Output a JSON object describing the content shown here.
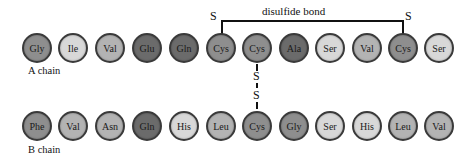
{
  "title": "disulfide bond",
  "colors": {
    "dark": "#6b6b6b",
    "medium": "#8e8e8e",
    "light": "#b3b3b3",
    "very_light": "#d8d8d8",
    "border": "#3a3a3a"
  },
  "a_chain": {
    "label": "A chain",
    "residues": [
      {
        "name": "Gly",
        "shade": "medium"
      },
      {
        "name": "Ile",
        "shade": "very_light"
      },
      {
        "name": "Val",
        "shade": "light"
      },
      {
        "name": "Glu",
        "shade": "dark"
      },
      {
        "name": "Gln",
        "shade": "dark"
      },
      {
        "name": "Cys",
        "shade": "medium"
      },
      {
        "name": "Cys",
        "shade": "medium"
      },
      {
        "name": "Ala",
        "shade": "dark"
      },
      {
        "name": "Ser",
        "shade": "very_light"
      },
      {
        "name": "Val",
        "shade": "light"
      },
      {
        "name": "Cys",
        "shade": "medium"
      },
      {
        "name": "Ser",
        "shade": "very_light"
      }
    ]
  },
  "b_chain": {
    "label": "B chain",
    "residues": [
      {
        "name": "Phe",
        "shade": "medium"
      },
      {
        "name": "Val",
        "shade": "light"
      },
      {
        "name": "Asn",
        "shade": "light"
      },
      {
        "name": "Gln",
        "shade": "dark"
      },
      {
        "name": "His",
        "shade": "very_light"
      },
      {
        "name": "Leu",
        "shade": "light"
      },
      {
        "name": "Cys",
        "shade": "medium"
      },
      {
        "name": "Gly",
        "shade": "medium"
      },
      {
        "name": "Ser",
        "shade": "very_light"
      },
      {
        "name": "His",
        "shade": "very_light"
      },
      {
        "name": "Leu",
        "shade": "light"
      },
      {
        "name": "Val",
        "shade": "light"
      }
    ]
  },
  "bonds": {
    "intra_chain": {
      "label": "disulfide bond",
      "s_left": "S",
      "s_right": "S",
      "from_index": 5,
      "to_index": 10
    },
    "inter_chain": {
      "s_top": "S",
      "s_bottom": "S",
      "a_index": 6,
      "b_index": 6
    }
  }
}
